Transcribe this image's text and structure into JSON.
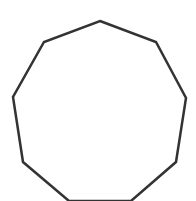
{
  "diagram": {
    "shape": "nonagon",
    "background": "#ffffff",
    "stroke": "#333333",
    "stroke_width": 2.5,
    "fill": "none",
    "vertices": [
      [
        100,
        21
      ],
      [
        156,
        42
      ],
      [
        186,
        98
      ],
      [
        176,
        162
      ],
      [
        131,
        201
      ],
      [
        69,
        201
      ],
      [
        23,
        162
      ],
      [
        13,
        97
      ],
      [
        44,
        42
      ]
    ]
  }
}
